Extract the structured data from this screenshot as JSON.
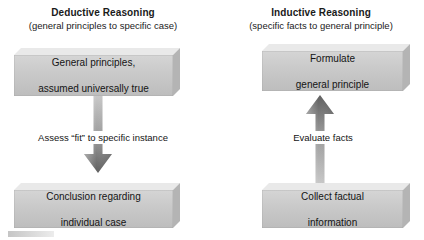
{
  "diagram": {
    "columns": [
      {
        "id": "deductive",
        "title": "Deductive Reasoning",
        "subtitle": "(general principles to specific case)",
        "top_box": "General principles,\nassumed universally true",
        "top_box_line1": "General principles,",
        "top_box_line2": "assumed universally true",
        "arrow_label": "Assess “fit” to specific instance",
        "arrow_direction": "down",
        "bottom_box_line1": "Conclusion regarding",
        "bottom_box_line2": "individual case"
      },
      {
        "id": "inductive",
        "title": "Inductive Reasoning",
        "subtitle": "(specific facts to general principle)",
        "top_box_line1": "Formulate",
        "top_box_line2": "general principle",
        "arrow_label": "Evaluate facts",
        "arrow_direction": "up",
        "bottom_box_line1": "Collect factual",
        "bottom_box_line2": "information"
      }
    ],
    "colors": {
      "box_face_light": "#d5d5d5",
      "box_face_dark": "#bdbdbd",
      "box_top_bevel": "#e9e9e9",
      "box_right_side": "#b4b4b4",
      "arrow_light": "#c3c3c3",
      "arrow_dark": "#6e6e6e",
      "text": "#141414",
      "background": "#ffffff"
    }
  }
}
